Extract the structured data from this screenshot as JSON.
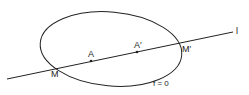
{
  "diagram": {
    "labels": {
      "M": "M",
      "A": "A",
      "A_prime": "A′",
      "M_prime": "M′",
      "line": "l",
      "curve": "f = 0"
    },
    "stroke_color": "#222222"
  }
}
